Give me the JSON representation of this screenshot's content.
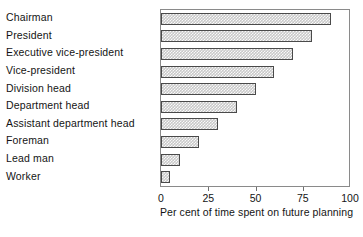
{
  "chart_data": {
    "type": "bar",
    "orientation": "horizontal",
    "title": "",
    "xlabel": "Per cent of time spent on future planning",
    "ylabel": "",
    "xlim": [
      0,
      100
    ],
    "xticks": [
      0,
      25,
      50,
      75,
      100
    ],
    "xticklabels": [
      "0",
      "25",
      "50",
      "75",
      "100"
    ],
    "grid": false,
    "legend": null,
    "bar_style": {
      "fill": "hatched-gray",
      "fill_color": "#c9c9c9",
      "edge_color": "#4a4a4a",
      "frame_color": "#8a8a8a",
      "background": "#ffffff"
    },
    "categories": [
      "Chairman",
      "President",
      "Executive vice-president",
      "Vice-president",
      "Division head",
      "Department head",
      "Assistant department head",
      "Foreman",
      "Lead man",
      "Worker"
    ],
    "values": [
      90,
      80,
      70,
      60,
      50,
      40,
      30,
      20,
      10,
      5
    ]
  }
}
